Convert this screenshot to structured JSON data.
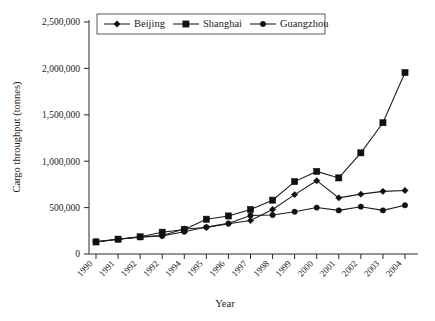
{
  "chart_data": {
    "type": "line",
    "title": "",
    "xlabel": "Year",
    "ylabel": "Cargo throughput (tonnes)",
    "categories": [
      "1990",
      "1991",
      "1992",
      "1992",
      "1994",
      "1995",
      "1996",
      "1997",
      "1998",
      "1999",
      "2000",
      "2001",
      "2002",
      "2003",
      "2004"
    ],
    "xtick_labels": [
      "1990",
      "1991",
      "1992",
      "1992",
      "1994",
      "1995",
      "1996",
      "1997",
      "1998",
      "1999",
      "2000",
      "2001",
      "2002",
      "2003",
      "2004"
    ],
    "ytick_labels": [
      "0",
      "500,000",
      "1,000,000",
      "1,500,000",
      "2,000,000",
      "2,500,000"
    ],
    "ytick_values": [
      0,
      500000,
      1000000,
      1500000,
      2000000,
      2500000
    ],
    "ylim": [
      0,
      2500000
    ],
    "grid": false,
    "legend_position": "top-center",
    "series": [
      {
        "name": "Beijing",
        "marker": "diamond",
        "color": "#111111",
        "values": [
          135000,
          160000,
          185000,
          200000,
          270000,
          285000,
          325000,
          360000,
          480000,
          640000,
          790000,
          605000,
          645000,
          675000,
          685000
        ]
      },
      {
        "name": "Shanghai",
        "marker": "square",
        "color": "#111111",
        "values": [
          130000,
          160000,
          185000,
          235000,
          265000,
          375000,
          410000,
          480000,
          580000,
          780000,
          890000,
          820000,
          1090000,
          1415000,
          1955000
        ]
      },
      {
        "name": "Guangzhou",
        "marker": "circle",
        "color": "#111111",
        "values": [
          130000,
          160000,
          180000,
          195000,
          240000,
          290000,
          330000,
          415000,
          420000,
          455000,
          500000,
          470000,
          510000,
          470000,
          525000
        ]
      }
    ]
  },
  "legend": {
    "items": [
      {
        "label": "Beijing",
        "marker": "diamond"
      },
      {
        "label": "Shanghai",
        "marker": "square"
      },
      {
        "label": "Guangzhou",
        "marker": "circle"
      }
    ]
  },
  "axes": {
    "x_title": "Year",
    "y_title": "Cargo throughput (tonnes)"
  }
}
